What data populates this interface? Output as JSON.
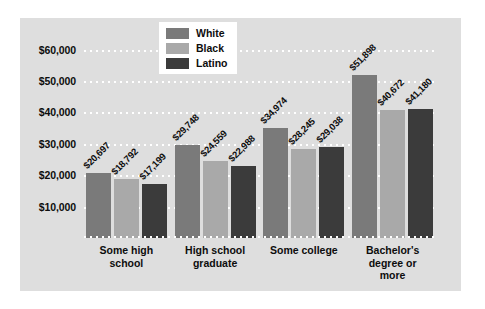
{
  "chart_data": {
    "type": "bar",
    "title": "",
    "xlabel": "",
    "ylabel": "",
    "ylim": [
      0,
      65000
    ],
    "grid": true,
    "legend_position": "top-center",
    "ytick_labels": [
      "$60,000",
      "$50,000",
      "$40,000",
      "$30,000",
      "$20,000",
      "$10,000"
    ],
    "ytick_values": [
      60000,
      50000,
      40000,
      30000,
      20000,
      10000
    ],
    "categories": [
      "Some high school",
      "High school graduate",
      "Some college",
      "Bachelor's degree or more"
    ],
    "category_lines": [
      [
        "Some high",
        "school"
      ],
      [
        "High school",
        "graduate"
      ],
      [
        "Some college"
      ],
      [
        "Bachelor's",
        "degree or",
        "more"
      ]
    ],
    "series": [
      {
        "name": "White",
        "color": "#7a7a7a",
        "values": [
          20697,
          29748,
          34974,
          51898
        ],
        "labels": [
          "$20,697",
          "$29,748",
          "$34,974",
          "$51,898"
        ]
      },
      {
        "name": "Black",
        "color": "#a9a9a9",
        "values": [
          18792,
          24559,
          28245,
          40672
        ],
        "labels": [
          "$18,792",
          "$24,559",
          "$28,245",
          "$40,672"
        ]
      },
      {
        "name": "Latino",
        "color": "#3b3b3b",
        "values": [
          17199,
          22988,
          29038,
          41180
        ],
        "labels": [
          "$17,199",
          "$22,988",
          "$29,038",
          "$41,180"
        ]
      }
    ]
  },
  "colors": {
    "panel_background": "#dedede",
    "page_background": "#ffffff",
    "gridline": "#ffffff",
    "text": "#0d0d0d",
    "legend_background": "#ffffff"
  }
}
